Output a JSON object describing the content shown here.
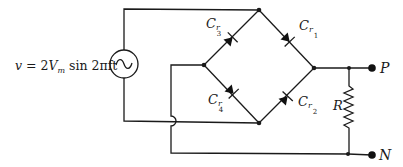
{
  "diagram": {
    "type": "full-wave bridge rectifier circuit",
    "source": {
      "label_prefix": "v",
      "label_equals": " = 2",
      "label_v": "V",
      "label_sub_m": "m",
      "label_rest": " sin 2πft",
      "symbol": "ac-source-sine"
    },
    "diodes": [
      {
        "id": "Cr1",
        "main": "C",
        "sub": "r",
        "subsub": "1"
      },
      {
        "id": "Cr2",
        "main": "C",
        "sub": "r",
        "subsub": "2"
      },
      {
        "id": "Cr3",
        "main": "C",
        "sub": "r",
        "subsub": "3"
      },
      {
        "id": "Cr4",
        "main": "C",
        "sub": "r",
        "subsub": "4"
      }
    ],
    "resistor": {
      "label": "R"
    },
    "terminals": {
      "positive": "P",
      "negative": "N"
    },
    "colors": {
      "line": "#1a1a1a",
      "background": "#ffffff"
    }
  }
}
